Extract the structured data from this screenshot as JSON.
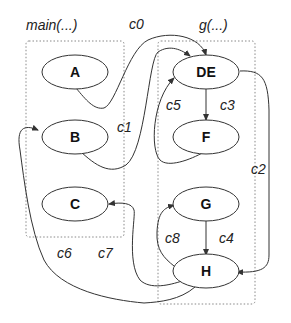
{
  "diagram": {
    "groups": [
      {
        "id": "main",
        "label": "main(...)"
      },
      {
        "id": "g",
        "label": "g(...)"
      }
    ],
    "nodes": [
      {
        "id": "A",
        "label": "A",
        "group": "main"
      },
      {
        "id": "B",
        "label": "B",
        "group": "main"
      },
      {
        "id": "C",
        "label": "C",
        "group": "main"
      },
      {
        "id": "DE",
        "label": "DE",
        "group": "g"
      },
      {
        "id": "F",
        "label": "F",
        "group": "g"
      },
      {
        "id": "G",
        "label": "G",
        "group": "g"
      },
      {
        "id": "H",
        "label": "H",
        "group": "g"
      }
    ],
    "edges": [
      {
        "id": "c0",
        "label": "c0",
        "from": "A",
        "to": "DE"
      },
      {
        "id": "c1",
        "label": "c1",
        "from": "B",
        "to": "DE"
      },
      {
        "id": "c2",
        "label": "c2",
        "from": "DE",
        "to": "H"
      },
      {
        "id": "c3",
        "label": "c3",
        "from": "DE",
        "to": "F"
      },
      {
        "id": "c4",
        "label": "c4",
        "from": "G",
        "to": "H"
      },
      {
        "id": "c5",
        "label": "c5",
        "from": "F",
        "to": "DE"
      },
      {
        "id": "c6",
        "label": "c6",
        "from": "H",
        "to": "B"
      },
      {
        "id": "c7",
        "label": "c7",
        "from": "H",
        "to": "C"
      },
      {
        "id": "c8",
        "label": "c8",
        "from": "H",
        "to": "G"
      }
    ]
  }
}
